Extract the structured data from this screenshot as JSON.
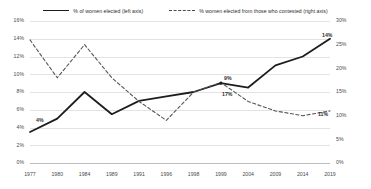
{
  "legend": {
    "series1_label": "% of women elected (left axis)",
    "series2_label": "% women elected from those who contested (right axis)",
    "series1_icon": "solid-line-swatch",
    "series2_icon": "dashed-line-swatch"
  },
  "axes": {
    "left_ticks": [
      "16%",
      "14%",
      "12%",
      "10%",
      "8%",
      "6%",
      "4%",
      "2%",
      "0%"
    ],
    "right_ticks": [
      "30%",
      "25%",
      "20%",
      "15%",
      "10%",
      "5%",
      "0%"
    ],
    "x_ticks": [
      "1977",
      "1980",
      "1984",
      "1989",
      "1991",
      "1996",
      "1998",
      "1999",
      "2004",
      "2009",
      "2014",
      "2019"
    ]
  },
  "point_labels": [
    {
      "text": "4%",
      "x": 36,
      "y": 118
    },
    {
      "text": "9%",
      "x": 224,
      "y": 76
    },
    {
      "text": "17%",
      "x": 222,
      "y": 92
    },
    {
      "text": "14%",
      "x": 322,
      "y": 33
    },
    {
      "text": "11%",
      "x": 318,
      "y": 112
    }
  ],
  "colors": {
    "series1": "#1d1d1d",
    "series2": "#555555",
    "grid": "#e3e3e3",
    "axis": "#bdbdbd",
    "text": "#4a4a4a",
    "background": "#ffffff"
  },
  "chart_data": {
    "type": "line",
    "title": "",
    "xlabel": "",
    "ylabel": "% of women elected",
    "y2label": "% women elected from those who contested",
    "grid": true,
    "legend_position": "top-center",
    "x": [
      "1977",
      "1980",
      "1984",
      "1989",
      "1991",
      "1996",
      "1998",
      "1999",
      "2004",
      "2009",
      "2014",
      "2019"
    ],
    "ylim": [
      0,
      16
    ],
    "y2lim": [
      0,
      30
    ],
    "series": [
      {
        "name": "% of women elected (left axis)",
        "axis": "left",
        "style": "solid",
        "values": [
          3.5,
          5.0,
          8.0,
          5.5,
          7.0,
          7.5,
          8.0,
          9.0,
          8.5,
          11.0,
          12.0,
          14.0
        ],
        "labeled_points": {
          "1977": "4%",
          "1999": "9%",
          "2019": "14%"
        }
      },
      {
        "name": "% women elected from those who contested (right axis)",
        "axis": "right",
        "style": "dashed",
        "values": [
          26.0,
          18.0,
          25.0,
          18.0,
          13.0,
          9.0,
          15.0,
          17.0,
          13.0,
          11.0,
          10.0,
          11.0
        ],
        "labeled_points": {
          "1999": "17%",
          "2019": "11%"
        }
      }
    ]
  }
}
